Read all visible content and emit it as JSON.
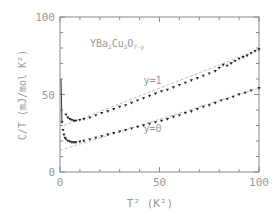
{
  "chart_data": {
    "type": "scatter",
    "title": "",
    "annotation": "YBa2Cu3O7-y",
    "annotation_parts": {
      "base": "YBa",
      "s1": "2",
      "m1": "Cu",
      "s2": "3",
      "m2": "O",
      "s3": "7-y"
    },
    "xlabel": "T² (K²)",
    "ylabel": "C/T (mJ/mol K²)",
    "xlim": [
      0,
      100
    ],
    "ylim": [
      0,
      100
    ],
    "x_ticks": [
      "0",
      "50",
      "100"
    ],
    "y_ticks": [
      "0",
      "50",
      "100"
    ],
    "grid": false,
    "legend_position": "inline labels",
    "series": [
      {
        "name": "y=1",
        "marker": "triangle-down",
        "x": [
          3,
          4,
          5,
          6,
          7,
          8,
          10,
          12,
          15,
          18,
          21,
          24,
          27,
          30,
          33,
          36,
          39,
          42,
          45,
          48,
          51,
          54,
          57,
          60,
          63,
          66,
          69,
          72,
          75,
          78,
          80,
          82,
          84,
          86,
          88,
          90,
          92,
          94,
          96,
          98,
          100
        ],
        "values": [
          37,
          35,
          34,
          33.5,
          33,
          33,
          33.5,
          34,
          35,
          36.5,
          38,
          39,
          40.5,
          42,
          43,
          44.5,
          46,
          47.5,
          49,
          50.5,
          52,
          53,
          54.5,
          56,
          57.5,
          59,
          60.5,
          62,
          63.5,
          65,
          67,
          69,
          68.5,
          70,
          71.5,
          73,
          74,
          75,
          76.5,
          78,
          79
        ]
      },
      {
        "name": "y=0",
        "marker": "triangle-down",
        "x": [
          1,
          1.5,
          2,
          2.5,
          3,
          4,
          5,
          6,
          7,
          8,
          10,
          12,
          15,
          18,
          21,
          24,
          27,
          30,
          33,
          36,
          39,
          42,
          45,
          48,
          51,
          54,
          57,
          60,
          63,
          66,
          69,
          72,
          75,
          78,
          81,
          84,
          87,
          90,
          93,
          96,
          100
        ],
        "values": [
          32,
          27,
          24,
          22,
          21,
          20,
          19.5,
          19,
          19,
          19,
          19.5,
          20,
          21,
          22,
          23,
          24,
          25,
          26,
          27,
          28,
          29,
          30,
          31,
          32,
          33,
          34,
          35.5,
          36.5,
          38,
          39,
          40.5,
          42,
          43,
          44.5,
          46,
          47,
          48.5,
          50,
          51,
          52.5,
          54
        ]
      }
    ],
    "fit_lines": [
      {
        "name": "y=1 fit",
        "x": [
          2,
          100
        ],
        "values": [
          30,
          79
        ]
      },
      {
        "name": "y=0 fit",
        "x": [
          0,
          100
        ],
        "values": [
          14,
          54
        ]
      }
    ],
    "inline_labels": [
      {
        "text": "y=1",
        "x": 42,
        "y": 57
      },
      {
        "text": "y=0",
        "x": 42,
        "y": 26
      }
    ]
  }
}
